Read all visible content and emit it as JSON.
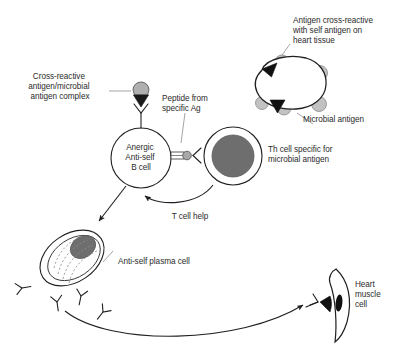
{
  "figure": {
    "background_color": "#ffffff",
    "ink_color": "#231f20",
    "leader_color": "#9a9a9a",
    "nucleus_fill": "#6e6e6e",
    "antigen_fill": "#b3b3b3",
    "bump_fill": "#c0c0c0",
    "peptide_fill": "#a8a8a8",
    "black_fill": "#111111"
  },
  "labels": {
    "cross_reactive_complex": {
      "lines": [
        "Cross-reactive",
        "antigen/microbial",
        "antigen complex"
      ],
      "align": "center"
    },
    "peptide_from_ag": {
      "lines": [
        "Peptide from",
        "specific Ag"
      ],
      "align": "left"
    },
    "antigen_cross_reactive_heart": {
      "lines": [
        "Antigen cross-reactive",
        "with self antigen on",
        "heart tissue"
      ],
      "align": "left"
    },
    "microbial_antigen": {
      "lines": [
        "Microbial antigen"
      ],
      "align": "left"
    },
    "th_cell": {
      "lines": [
        "Th cell specific for",
        "microbial antigen"
      ],
      "align": "left"
    },
    "b_cell": {
      "lines": [
        "Anergic",
        "Anti-self",
        "B cell"
      ],
      "align": "center"
    },
    "t_cell_help": {
      "lines": [
        "T cell help"
      ],
      "align": "center"
    },
    "plasma_cell": {
      "lines": [
        "Anti-self plasma cell"
      ],
      "align": "left"
    },
    "heart_muscle_cell": {
      "lines": [
        "Heart",
        "muscle",
        "cell"
      ],
      "align": "left"
    }
  },
  "elements": {
    "b_cell_receptor": "y-receptor-icon",
    "antigen_complex": "antigen-complex-icon",
    "mhc_peptide": "mhc-peptide-icon",
    "t_cell_receptor": "tcr-icon",
    "microbial_antigen_body": "microbe-blob-icon",
    "antibody": "antibody-y-icon",
    "heart_cell_body": "heart-muscle-cell-icon"
  }
}
